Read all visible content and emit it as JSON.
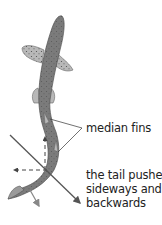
{
  "diagram": {
    "labels": {
      "median_fins": "median fins",
      "tail_push": [
        "the tail pushes",
        "sideways and",
        "backwards"
      ]
    },
    "colors": {
      "body": "#7b7b7b",
      "body_outline": "#555555",
      "fins": "#b8b8b8",
      "spots": "#4a4a4a",
      "main_arrow": "#555555",
      "component_arrows": "#888888",
      "leader_lines": "#333333",
      "text": "#222222"
    },
    "arrows": [
      {
        "name": "tail-thrust-arrow",
        "style": "solid",
        "direction": "diagonal down-right"
      },
      {
        "name": "forward-component-arrow",
        "style": "dashed",
        "direction": "up"
      },
      {
        "name": "sideways-component-arrow",
        "style": "dashed",
        "direction": "left"
      },
      {
        "name": "tail-backwards-arrow",
        "style": "solid",
        "direction": "down"
      }
    ]
  }
}
